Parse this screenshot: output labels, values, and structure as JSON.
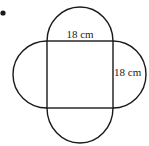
{
  "diagram": {
    "marker": "•",
    "square_side_top_label": "18 cm",
    "square_side_right_label": "18 cm",
    "colors": {
      "stroke": "#1a1a1a",
      "background": "#ffffff"
    }
  }
}
